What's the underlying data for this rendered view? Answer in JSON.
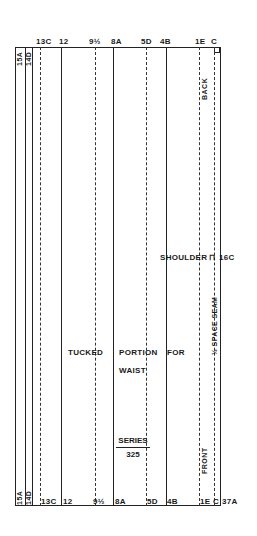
{
  "pattern": {
    "top_labels": [
      "13C",
      "12",
      "9½",
      "8A",
      "5D",
      "4B",
      "1E",
      "C"
    ],
    "bottom_labels": [
      "13C",
      "12",
      "9½",
      "8A",
      "5D",
      "4B",
      "1E",
      "C"
    ],
    "bottom_extra": "37A",
    "left_rotated": [
      "15A",
      "14D"
    ],
    "back_label": "BACK",
    "front_label": "FRONT",
    "shoulder_label": "SHOULDER",
    "shoulder_ref": "16C",
    "seam_label": "½ SPACE SEAM",
    "instruction": {
      "tucked": "TUCKED",
      "portion": "PORTION",
      "for": "FOR",
      "waist": "WAIST"
    },
    "series_label": "SERIES",
    "series_number": "325"
  }
}
